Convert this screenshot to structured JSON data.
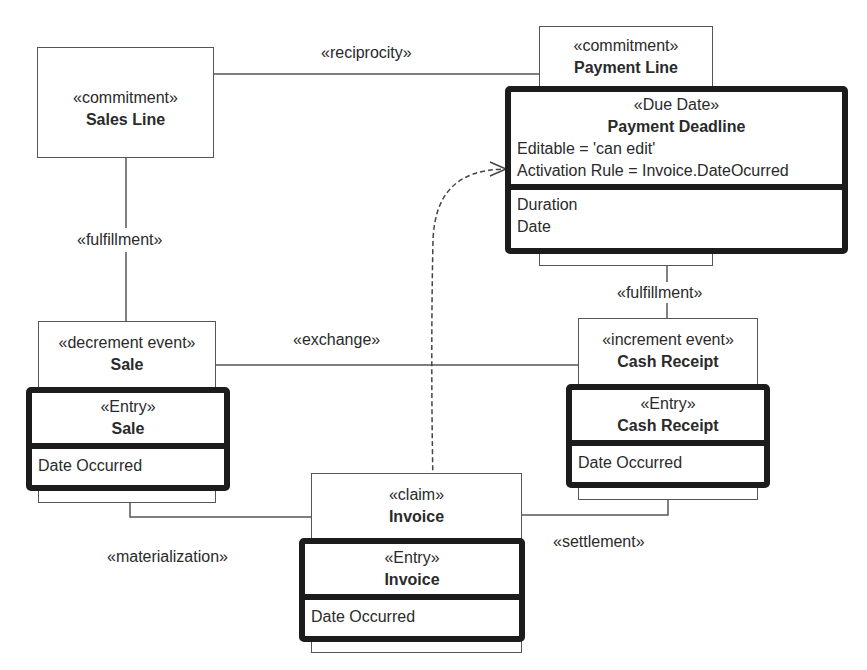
{
  "diagram": {
    "type": "UML class diagram (REA business model)",
    "classes": {
      "sales_line": {
        "stereotype": "«commitment»",
        "name": "Sales Line"
      },
      "payment_line": {
        "stereotype": "«commitment»",
        "name": "Payment Line"
      },
      "payment_deadline": {
        "stereotype": "«Due Date»",
        "name": "Payment Deadline",
        "tags": [
          "Editable = 'can edit'",
          "Activation Rule = Invoice.DateOcurred"
        ],
        "attributes": [
          "Duration",
          "Date"
        ]
      },
      "sale_event": {
        "stereotype": "«decrement event»",
        "name": "Sale"
      },
      "sale_entry": {
        "stereotype": "«Entry»",
        "name": "Sale",
        "attributes": [
          "Date Occurred"
        ]
      },
      "cash_receipt_event": {
        "stereotype": "«increment event»",
        "name": "Cash Receipt"
      },
      "cash_receipt_entry": {
        "stereotype": "«Entry»",
        "name": "Cash Receipt",
        "attributes": [
          "Date Occurred"
        ]
      },
      "invoice_claim": {
        "stereotype": "«claim»",
        "name": "Invoice"
      },
      "invoice_entry": {
        "stereotype": "«Entry»",
        "name": "Invoice",
        "attributes": [
          "Date Occurred"
        ]
      }
    },
    "associations": {
      "reciprocity": "«reciprocity»",
      "fulfillment_left": "«fulfillment»",
      "fulfillment_right": "«fulfillment»",
      "exchange": "«exchange»",
      "materialization": "«materialization»",
      "settlement": "«settlement»"
    },
    "dependency": {
      "from": "Invoice.Date Occurred",
      "to": "Payment Deadline",
      "style": "dashed-open-arrow"
    },
    "colors": {
      "line": "#555555",
      "thick_border": "#1c1c1c",
      "text": "#2a2a2a",
      "background": "#ffffff"
    }
  }
}
